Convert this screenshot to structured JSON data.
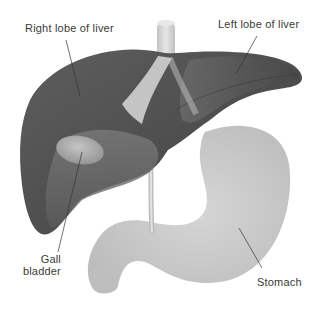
{
  "diagram": {
    "labels": {
      "right_lobe": "Right lobe of liver",
      "left_lobe": "Left lobe of liver",
      "gall_line1": "Gall",
      "gall_line2": "bladder",
      "stomach": "Stomach"
    },
    "structures": [
      {
        "name": "Right lobe of liver",
        "color": "#555555"
      },
      {
        "name": "Left lobe of liver",
        "color": "#5a5a5a"
      },
      {
        "name": "Gall bladder",
        "color": "#b8b8b8"
      },
      {
        "name": "Stomach",
        "color": "#c8c8c8"
      },
      {
        "name": "Esophagus / vessel",
        "color": "#d4d4d4"
      },
      {
        "name": "Bile duct",
        "color": "#cfcfcf"
      }
    ],
    "colors": {
      "background": "#ffffff",
      "liver_dark": "#4a4a4a",
      "liver_mid": "#6a6a6a",
      "stomach": "#c9c9c9",
      "leader_line": "#333333",
      "text": "#3a3a3a"
    }
  }
}
